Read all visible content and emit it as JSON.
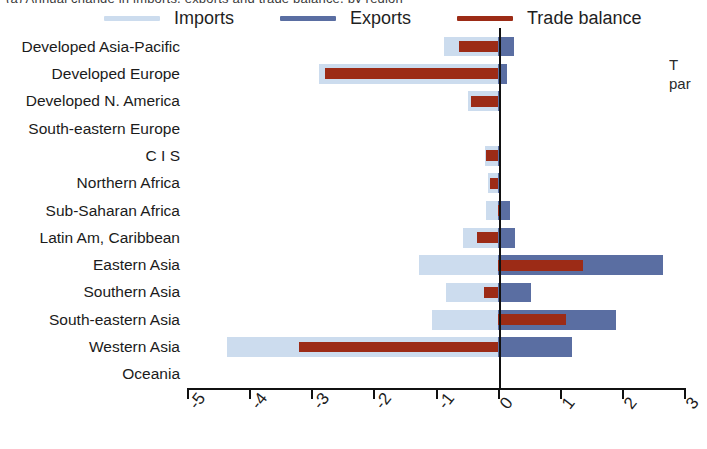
{
  "title_sliver": "(a) Annual change in imports, exports and trade balance, by region",
  "side_text": {
    "line1": "T",
    "line2": "par"
  },
  "colors": {
    "imports": "#ccdcee",
    "exports": "#5a6ea2",
    "balance": "#9c2b16",
    "axis": "#111111"
  },
  "legend": {
    "items": [
      {
        "label": "Imports",
        "color_key": "imports"
      },
      {
        "label": "Exports",
        "color_key": "exports"
      },
      {
        "label": "Trade balance",
        "color_key": "balance"
      }
    ]
  },
  "chart_data": {
    "type": "bar",
    "orientation": "horizontal",
    "title": "",
    "xlabel": "",
    "ylabel": "",
    "xlim": [
      -5,
      3
    ],
    "xticks": [
      -5,
      -4,
      -3,
      -2,
      -1,
      0,
      1,
      2,
      3
    ],
    "xticklabels": [
      "-5",
      "-4",
      "-3",
      "-2",
      "-1",
      "0",
      "1",
      "2",
      "3"
    ],
    "grid": false,
    "legend_position": "top",
    "categories": [
      "Developed Asia-Pacific",
      "Developed Europe",
      "Developed N. America",
      "South-eastern Europe",
      "C I S",
      "Northern Africa",
      "Sub-Saharan Africa",
      "Latin Am, Caribbean",
      "Eastern Asia",
      "Southern Asia",
      "South-eastern Asia",
      "Western Asia",
      "Oceania"
    ],
    "series": [
      {
        "name": "Imports",
        "color_key": "imports",
        "values": [
          -0.87,
          -2.88,
          -0.47,
          0.0,
          -0.21,
          -0.16,
          -0.18,
          -0.56,
          -1.27,
          -0.83,
          -1.05,
          -4.35,
          0.0
        ]
      },
      {
        "name": "Exports",
        "color_key": "exports",
        "values": [
          0.27,
          0.15,
          0.04,
          0.0,
          0.02,
          0.03,
          0.2,
          0.28,
          2.67,
          0.53,
          1.9,
          1.2,
          0.0
        ]
      },
      {
        "name": "Trade balance",
        "color_key": "balance",
        "values": [
          -0.62,
          -2.78,
          -0.43,
          0.0,
          -0.18,
          -0.13,
          0.04,
          -0.34,
          1.37,
          -0.22,
          1.1,
          -3.2,
          0.0
        ]
      }
    ]
  }
}
